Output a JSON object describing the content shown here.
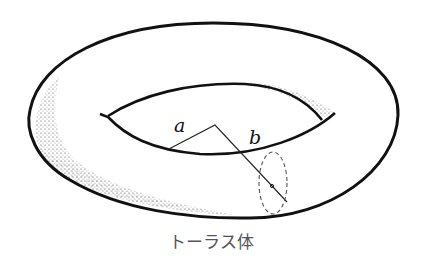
{
  "figure": {
    "title": "トーラス体",
    "labels": {
      "major_radius": "a",
      "minor_radius": "b"
    },
    "colors": {
      "stroke": "#111111",
      "dashed": "#555555",
      "stipple": "#333333",
      "caption": "#555555"
    }
  }
}
